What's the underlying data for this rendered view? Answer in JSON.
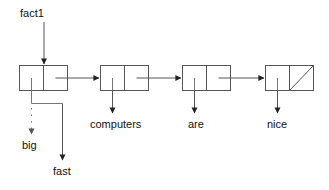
{
  "diagram": {
    "type": "linked-list-cons-cell-diagram",
    "colors": {
      "stroke": "#555555",
      "arrow": "#222222",
      "text": "#111111",
      "background": "#ffffff"
    },
    "pointer_label": {
      "name": "fact1",
      "text": "fact1",
      "x": 20,
      "y": 7
    },
    "cells": [
      {
        "name": "cons-cell-1",
        "index": 0,
        "x": 19,
        "y": 65,
        "width": 49,
        "height": 26,
        "car_value": "",
        "car_label": "big",
        "car_label_alt": "fast",
        "cdr_nil": false
      },
      {
        "name": "cons-cell-2",
        "index": 1,
        "x": 100,
        "y": 65,
        "width": 49,
        "height": 26,
        "car_value": "",
        "car_label": "computers",
        "cdr_nil": false
      },
      {
        "name": "cons-cell-3",
        "index": 2,
        "x": 182,
        "y": 65,
        "width": 49,
        "height": 26,
        "car_value": "",
        "car_label": "are",
        "cdr_nil": false
      },
      {
        "name": "cons-cell-4",
        "index": 3,
        "x": 265,
        "y": 65,
        "width": 49,
        "height": 26,
        "car_value": "",
        "car_label": "nice",
        "cdr_nil": true
      }
    ],
    "labels": [
      {
        "name": "label-big",
        "text": "big",
        "x": 22,
        "y": 139,
        "style": "dotted-pointer"
      },
      {
        "name": "label-fast",
        "text": "fast",
        "x": 53,
        "y": 165,
        "style": "solid-pointer"
      },
      {
        "name": "label-computers",
        "text": "computers",
        "x": 90,
        "y": 118,
        "style": "solid-pointer"
      },
      {
        "name": "label-are",
        "text": "are",
        "x": 188,
        "y": 118,
        "style": "solid-pointer"
      },
      {
        "name": "label-nice",
        "text": "nice",
        "x": 267,
        "y": 118,
        "style": "solid-pointer"
      }
    ]
  }
}
